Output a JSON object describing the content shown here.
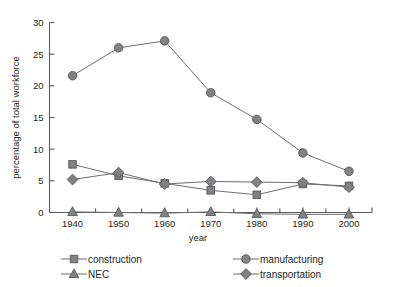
{
  "chart_data": {
    "type": "line",
    "title": "",
    "xlabel": "year",
    "ylabel": "percentage of total workforce",
    "x": [
      1940,
      1950,
      1960,
      1970,
      1980,
      1990,
      2000
    ],
    "categories": [
      "1940",
      "1950",
      "1960",
      "1970",
      "1980",
      "1990",
      "2000"
    ],
    "xlim": [
      1935,
      2005
    ],
    "ylim": [
      0,
      30
    ],
    "yticks": [
      0,
      5,
      10,
      15,
      20,
      25,
      30
    ],
    "ytick_labels": [
      "0",
      "5",
      "10",
      "15",
      "20",
      "25",
      "30"
    ],
    "xticks": [
      1940,
      1950,
      1960,
      1970,
      1980,
      1990,
      2000
    ],
    "grid": false,
    "legend_position": "bottom",
    "series": [
      {
        "name": "construction",
        "marker": "square",
        "color": "#808285",
        "values": [
          7.6,
          5.8,
          4.6,
          3.5,
          2.8,
          4.5,
          4.2
        ]
      },
      {
        "name": "NEC",
        "marker": "triangle",
        "color": "#808285",
        "values": [
          0.1,
          0.0,
          -0.1,
          0.1,
          -0.2,
          -0.3,
          -0.3
        ]
      },
      {
        "name": "manufacturing",
        "marker": "circle",
        "color": "#808285",
        "values": [
          21.6,
          26.0,
          27.1,
          18.9,
          14.7,
          9.4,
          6.5
        ]
      },
      {
        "name": "transportation",
        "marker": "diamond",
        "color": "#808285",
        "values": [
          5.2,
          6.3,
          4.5,
          4.9,
          4.8,
          4.7,
          4.0
        ]
      }
    ]
  },
  "legend": {
    "entries": [
      {
        "label": "construction",
        "marker": "square"
      },
      {
        "label": "NEC",
        "marker": "triangle"
      },
      {
        "label": "manufacturing",
        "marker": "circle"
      },
      {
        "label": "transportation",
        "marker": "diamond"
      }
    ]
  },
  "colors": {
    "marker_fill": "#808285",
    "marker_stroke": "#58595b",
    "line": "#6d6e71",
    "axis": "#58595b",
    "text": "#231f20",
    "background": "#ffffff"
  }
}
